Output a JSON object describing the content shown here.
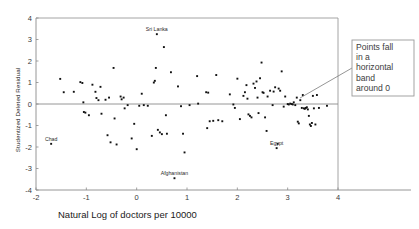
{
  "chart_data": {
    "type": "scatter",
    "title": "",
    "xlabel": "Natural Log of doctors per 10000",
    "ylabel": "Studentized Deleted Residual",
    "xlim": [
      -2,
      4
    ],
    "ylim": [
      -4,
      4
    ],
    "xticks": [
      -2,
      -1,
      0,
      1,
      2,
      3,
      4
    ],
    "yticks": [
      -4,
      -3,
      -2,
      -1,
      0,
      1,
      2,
      3,
      4
    ],
    "grid": false,
    "legend": null,
    "reference_lines": [
      {
        "orientation": "horizontal",
        "y": 0
      }
    ],
    "annotations": [
      {
        "text": "Points fall in a horizontal band around 0",
        "lines": [
          "Points fall",
          "in a",
          "horizontal",
          "band",
          "around 0"
        ],
        "box": {
          "x": 352,
          "y": 40,
          "width": 62,
          "height": 56
        },
        "pointer_from": [
          352,
          68
        ],
        "pointer_to": [
          300,
          98
        ]
      }
    ],
    "point_labels": [
      {
        "label": "Sri Lanka",
        "x": 0.4,
        "y": 3.25
      },
      {
        "label": "Chad",
        "x": -1.7,
        "y": -1.85
      },
      {
        "label": "Afghanistan",
        "x": 0.75,
        "y": -3.45
      },
      {
        "label": "Egypt",
        "x": 2.78,
        "y": -2.05
      }
    ],
    "points": [
      [
        -1.7,
        -1.85
      ],
      [
        -1.52,
        1.17
      ],
      [
        -1.45,
        0.55
      ],
      [
        -1.25,
        0.57
      ],
      [
        -1.12,
        1.02
      ],
      [
        -1.08,
        0.98
      ],
      [
        -1.06,
        0.08
      ],
      [
        -1.05,
        -0.37
      ],
      [
        -1.02,
        -0.4
      ],
      [
        -0.95,
        -0.52
      ],
      [
        -0.88,
        0.9
      ],
      [
        -0.82,
        0.57
      ],
      [
        -0.8,
        0.28
      ],
      [
        -0.76,
        0.18
      ],
      [
        -0.72,
        0.8
      ],
      [
        -0.7,
        -0.45
      ],
      [
        -0.62,
        0.2
      ],
      [
        -0.58,
        -1.45
      ],
      [
        -0.55,
        0.3
      ],
      [
        -0.52,
        -1.78
      ],
      [
        -0.46,
        1.68
      ],
      [
        -0.44,
        -0.67
      ],
      [
        -0.4,
        -1.88
      ],
      [
        -0.32,
        0.35
      ],
      [
        -0.3,
        0.22
      ],
      [
        -0.26,
        0.3
      ],
      [
        -0.24,
        -0.2
      ],
      [
        -0.18,
        -0.05
      ],
      [
        -0.1,
        -1.6
      ],
      [
        -0.05,
        -0.92
      ],
      [
        0.0,
        -2.1
      ],
      [
        0.05,
        -0.08
      ],
      [
        0.1,
        0.48
      ],
      [
        0.14,
        -0.05
      ],
      [
        0.22,
        -0.08
      ],
      [
        0.3,
        -1.48
      ],
      [
        0.34,
        1.0
      ],
      [
        0.36,
        1.08
      ],
      [
        0.38,
        1.68
      ],
      [
        0.4,
        3.25
      ],
      [
        0.42,
        -1.2
      ],
      [
        0.46,
        -1.32
      ],
      [
        0.5,
        -1.4
      ],
      [
        0.54,
        2.65
      ],
      [
        0.58,
        -0.52
      ],
      [
        0.6,
        -1.38
      ],
      [
        0.68,
        1.48
      ],
      [
        0.75,
        -3.45
      ],
      [
        0.82,
        0.82
      ],
      [
        0.88,
        -0.1
      ],
      [
        0.92,
        -1.38
      ],
      [
        0.95,
        -2.25
      ],
      [
        1.05,
        -0.05
      ],
      [
        1.2,
        1.3
      ],
      [
        1.22,
        0.02
      ],
      [
        1.38,
        0.55
      ],
      [
        1.4,
        -1.12
      ],
      [
        1.42,
        0.53
      ],
      [
        1.45,
        -0.8
      ],
      [
        1.52,
        -0.78
      ],
      [
        1.58,
        1.35
      ],
      [
        1.62,
        -0.75
      ],
      [
        1.7,
        -0.8
      ],
      [
        1.85,
        0.45
      ],
      [
        1.92,
        -0.02
      ],
      [
        1.95,
        -0.18
      ],
      [
        2.0,
        1.18
      ],
      [
        2.05,
        -0.7
      ],
      [
        2.12,
        0.38
      ],
      [
        2.15,
        0.55
      ],
      [
        2.18,
        0.88
      ],
      [
        2.2,
        0.25
      ],
      [
        2.22,
        -0.48
      ],
      [
        2.25,
        -0.55
      ],
      [
        2.28,
        -0.62
      ],
      [
        2.32,
        0.95
      ],
      [
        2.35,
        0.75
      ],
      [
        2.38,
        1.05
      ],
      [
        2.4,
        0.3
      ],
      [
        2.42,
        -0.42
      ],
      [
        2.45,
        1.2
      ],
      [
        2.48,
        1.93
      ],
      [
        2.5,
        0.55
      ],
      [
        2.52,
        0.52
      ],
      [
        2.55,
        -0.62
      ],
      [
        2.58,
        -1.25
      ],
      [
        2.6,
        0.35
      ],
      [
        2.65,
        0.62
      ],
      [
        2.7,
        -0.05
      ],
      [
        2.72,
        0.58
      ],
      [
        2.75,
        0.78
      ],
      [
        2.78,
        -2.05
      ],
      [
        2.8,
        -1.85
      ],
      [
        2.82,
        0.72
      ],
      [
        2.85,
        0.62
      ],
      [
        2.88,
        1.52
      ],
      [
        2.92,
        -0.12
      ],
      [
        2.95,
        0.35
      ],
      [
        3.0,
        0.0
      ],
      [
        3.02,
        -0.02
      ],
      [
        3.05,
        0.02
      ],
      [
        3.08,
        0.0
      ],
      [
        3.1,
        -0.02
      ],
      [
        3.12,
        0.08
      ],
      [
        3.15,
        -0.05
      ],
      [
        3.18,
        0.3
      ],
      [
        3.2,
        -0.82
      ],
      [
        3.22,
        -0.9
      ],
      [
        3.25,
        0.18
      ],
      [
        3.28,
        -0.18
      ],
      [
        3.3,
        0.42
      ],
      [
        3.32,
        -0.2
      ],
      [
        3.34,
        -0.22
      ],
      [
        3.36,
        -0.18
      ],
      [
        3.38,
        -0.15
      ],
      [
        3.4,
        -0.25
      ],
      [
        3.42,
        -0.55
      ],
      [
        3.44,
        -0.95
      ],
      [
        3.46,
        -1.02
      ],
      [
        3.48,
        -0.88
      ],
      [
        3.5,
        0.38
      ],
      [
        3.52,
        -0.2
      ],
      [
        3.55,
        -0.95
      ],
      [
        3.58,
        0.42
      ],
      [
        3.62,
        -0.18
      ],
      [
        3.78,
        -0.08
      ]
    ]
  }
}
